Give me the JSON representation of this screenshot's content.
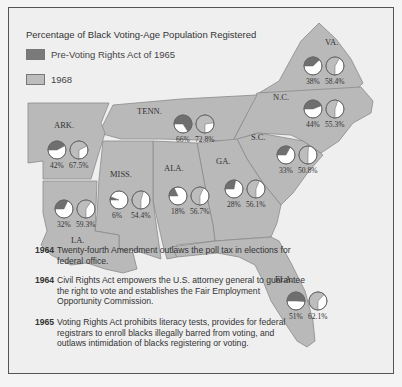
{
  "title": "Percentage of Black Voting-Age Population Registered",
  "legend": [
    {
      "label": "Pre-Voting Rights Act of 1965",
      "color": "#7a7a7a"
    },
    {
      "label": "1968",
      "color": "#bdbdbd"
    }
  ],
  "colors": {
    "pre": "#6f6f6f",
    "post": "#bdbdbd",
    "empty": "#ffffff",
    "land": "#b9b9b9",
    "water": "#efefef",
    "border": "#8a8a8a"
  },
  "chart_data": {
    "type": "pie",
    "title": "Percentage of Black Voting-Age Population Registered",
    "series": [
      {
        "name": "Pre-Voting Rights Act of 1965",
        "values": {
          "VA.": 38,
          "N.C.": 44,
          "S.C.": 33,
          "GA.": 28,
          "FLA.": 51,
          "ALA.": 18,
          "MISS.": 6,
          "LA.": 32,
          "ARK.": 42,
          "TENN.": 66
        }
      },
      {
        "name": "1968",
        "values": {
          "VA.": 58.4,
          "N.C.": 55.3,
          "S.C.": 50.8,
          "GA.": 56.1,
          "FLA.": 62.1,
          "ALA.": 56.7,
          "MISS.": 54.4,
          "LA.": 59.3,
          "ARK.": 67.5,
          "TENN.": 72.8
        }
      }
    ]
  },
  "states": [
    {
      "name": "VA.",
      "label": "VA.",
      "lx": 324,
      "ly": 36,
      "px": 302,
      "py": 55,
      "pre": 38,
      "pre_label": "38%",
      "post": 58.4,
      "post_label": "58.4%"
    },
    {
      "name": "N.C.",
      "label": "N.C.",
      "lx": 272,
      "ly": 91,
      "px": 302,
      "py": 98,
      "pre": 44,
      "pre_label": "44%",
      "post": 55.3,
      "post_label": "55.3%"
    },
    {
      "name": "TENN.",
      "label": "TENN.",
      "lx": 136,
      "ly": 105,
      "px": 172,
      "py": 113,
      "pre": 66,
      "pre_label": "66%",
      "post": 72.8,
      "post_label": "72.8%"
    },
    {
      "name": "ARK.",
      "label": "ARK.",
      "lx": 53,
      "ly": 119,
      "px": 46,
      "py": 139,
      "pre": 42,
      "pre_label": "42%",
      "post": 67.5,
      "post_label": "67.5%"
    },
    {
      "name": "S.C.",
      "label": "S.C.",
      "lx": 250,
      "ly": 131,
      "px": 275,
      "py": 144,
      "pre": 33,
      "pre_label": "33%",
      "post": 50.8,
      "post_label": "50.8%"
    },
    {
      "name": "GA.",
      "label": "GA.",
      "lx": 215,
      "ly": 155,
      "px": 223,
      "py": 178,
      "pre": 28,
      "pre_label": "28%",
      "post": 56.1,
      "post_label": "56.1%"
    },
    {
      "name": "MISS.",
      "label": "MISS.",
      "lx": 109,
      "ly": 168,
      "px": 108,
      "py": 189,
      "pre": 6,
      "pre_label": "6%",
      "post": 54.4,
      "post_label": "54.4%"
    },
    {
      "name": "ALA.",
      "label": "ALA.",
      "lx": 163,
      "ly": 162,
      "px": 167,
      "py": 185,
      "pre": 18,
      "pre_label": "18%",
      "post": 56.7,
      "post_label": "56.7%"
    },
    {
      "name": "LA.",
      "label": "LA.",
      "lx": 70,
      "ly": 234,
      "px": 53,
      "py": 198,
      "pre": 32,
      "pre_label": "32%",
      "post": 59.3,
      "post_label": "59.3%"
    },
    {
      "name": "FLA.",
      "label": "FLA.",
      "lx": 274,
      "ly": 273,
      "px": 285,
      "py": 290,
      "pre": 51,
      "pre_label": "51%",
      "post": 62.1,
      "post_label": "62.1%"
    }
  ],
  "timeline": [
    {
      "year": "1964",
      "text": "Twenty-fourth Amendment outlaws the poll tax in elections for federal office."
    },
    {
      "year": "1964",
      "text": "Civil Rights Act empowers the U.S. attorney general to guarantee the right to vote and establishes the Fair Employment Opportunity Commission."
    },
    {
      "year": "1965",
      "text": "Voting Rights Act prohibits literacy tests, provides for federal registrars to enroll blacks illegally barred from voting, and outlaws intimidation of blacks registering or voting."
    }
  ]
}
